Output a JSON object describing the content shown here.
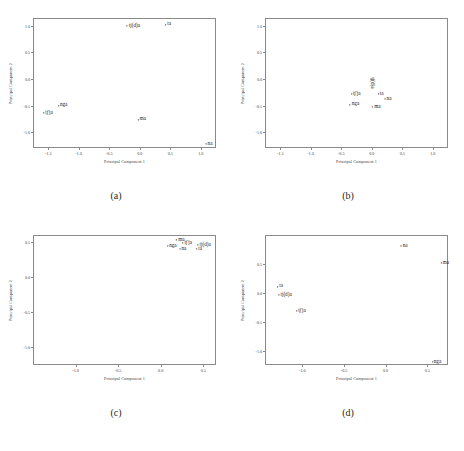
{
  "figure": {
    "panel_count": 4,
    "axis_line_color": "#8a8a8a",
    "text_color": "#1a1a1a",
    "background": "#ffffff"
  },
  "captions": {
    "a": "(a)",
    "b": "(b)",
    "c": "(c)",
    "d": "(d)"
  },
  "chart_data": [
    {
      "type": "scatter",
      "panel": "(a)",
      "title": "",
      "xlabel": "Principal Component 1",
      "ylabel": "Principal Component 2",
      "xlim": [
        -1.75,
        1.25
      ],
      "ylim": [
        -1.3,
        1.15
      ],
      "xticks": [
        -1.5,
        -1.0,
        -0.5,
        0.0,
        0.5,
        1.0
      ],
      "xticklabels": [
        "-1.5",
        "-1.0",
        "-0.5",
        "0.0",
        "0.5",
        "1.0"
      ],
      "yticks": [
        -1.0,
        -0.5,
        0.0,
        0.5,
        1.0
      ],
      "yticklabels": [
        "-1.0",
        "-0.5",
        "0.0",
        "0.5",
        "1.0"
      ],
      "grid": false,
      "legend": "none",
      "point_labels": [
        "tj(d)a",
        "ta",
        "nga",
        "tj'ja",
        "ma",
        "na"
      ],
      "points": [
        {
          "label": "tj(d)a",
          "x": -0.12,
          "y": 1.02
        },
        {
          "label": "ta",
          "x": 0.45,
          "y": 1.05
        },
        {
          "label": "nga",
          "x": -1.28,
          "y": -0.48
        },
        {
          "label": "tj'ja",
          "x": -1.52,
          "y": -0.62
        },
        {
          "label": "ma",
          "x": 0.02,
          "y": -0.74
        },
        {
          "label": "na",
          "x": 1.12,
          "y": -1.2
        }
      ]
    },
    {
      "type": "scatter",
      "panel": "(b)",
      "title": "",
      "xlabel": "Principal Component 1",
      "ylabel": "Principal Component 2",
      "xlim": [
        -1.75,
        1.25
      ],
      "ylim": [
        -1.3,
        1.15
      ],
      "xticks": [
        -1.5,
        -1.0,
        -0.5,
        0.0,
        0.5,
        1.0
      ],
      "xticklabels": [
        "-1.5",
        "-1.0",
        "-0.5",
        "0.0",
        "0.5",
        "1.0"
      ],
      "yticks": [
        -1.0,
        -0.5,
        0.0,
        0.5,
        1.0
      ],
      "yticklabels": [
        "-1.0",
        "-0.5",
        "0.0",
        "0.5",
        "1.0"
      ],
      "grid": false,
      "legend": "none",
      "point_labels": [
        "tj(d)a",
        "tj'ja",
        "ta",
        "na",
        "nga",
        "ma"
      ],
      "points": [
        {
          "label": "tj(d)a",
          "x": 0.0,
          "y": -0.05,
          "orientation": "vertical"
        },
        {
          "label": "tj'ja",
          "x": -0.28,
          "y": -0.26
        },
        {
          "label": "ta",
          "x": 0.13,
          "y": -0.26
        },
        {
          "label": "na",
          "x": 0.25,
          "y": -0.36
        },
        {
          "label": "nga",
          "x": -0.3,
          "y": -0.46
        },
        {
          "label": "ma",
          "x": 0.06,
          "y": -0.5
        }
      ]
    },
    {
      "type": "scatter",
      "panel": "(c)",
      "title": "",
      "xlabel": "Principal Component 1",
      "ylabel": "Principal Component 2",
      "xlim": [
        -1.5,
        0.65
      ],
      "ylim": [
        -1.25,
        0.6
      ],
      "xticks": [
        -1.0,
        -0.5,
        0.0,
        0.5
      ],
      "xticklabels": [
        "-1.0",
        "-0.5",
        "0.0",
        "0.5"
      ],
      "yticks": [
        -1.0,
        -0.5,
        0.0,
        0.5
      ],
      "yticklabels": [
        "-1.0",
        "-0.5",
        "0.0",
        "0.5"
      ],
      "grid": false,
      "legend": "none",
      "point_labels": [
        "ma",
        "tj'ja",
        "nga",
        "na",
        "ta",
        "tj(d)a"
      ],
      "points": [
        {
          "label": "ma",
          "x": 0.22,
          "y": 0.55
        },
        {
          "label": "tj'ja",
          "x": 0.3,
          "y": 0.5
        },
        {
          "label": "nga",
          "x": 0.12,
          "y": 0.46
        },
        {
          "label": "na",
          "x": 0.25,
          "y": 0.42
        },
        {
          "label": "ta",
          "x": 0.44,
          "y": 0.42
        },
        {
          "label": "tj(d)a",
          "x": 0.5,
          "y": 0.47
        }
      ]
    },
    {
      "type": "scatter",
      "panel": "(d)",
      "title": "",
      "xlabel": "Principal Component 1",
      "ylabel": "Principal Component 2",
      "xlim": [
        -1.45,
        0.75
      ],
      "ylim": [
        -1.25,
        1.0
      ],
      "xticks": [
        -1.0,
        -0.5,
        0.0,
        0.5
      ],
      "xticklabels": [
        "-1.0",
        "-0.5",
        "0.0",
        "0.5"
      ],
      "yticks": [
        -1.0,
        -0.5,
        0.0,
        0.5
      ],
      "yticklabels": [
        "-1.0",
        "-0.5",
        "0.0",
        "0.5"
      ],
      "grid": false,
      "legend": "none",
      "point_labels": [
        "na",
        "ma",
        "ta",
        "tj(d)a",
        "tj'ja",
        "nga"
      ],
      "points": [
        {
          "label": "na",
          "x": 0.21,
          "y": 0.83
        },
        {
          "label": "ma",
          "x": 0.7,
          "y": 0.53
        },
        {
          "label": "ta",
          "x": -1.28,
          "y": 0.13
        },
        {
          "label": "tj(d)a",
          "x": -1.22,
          "y": -0.02
        },
        {
          "label": "tj'ja",
          "x": -1.03,
          "y": -0.3
        },
        {
          "label": "nga",
          "x": 0.6,
          "y": -1.18
        }
      ]
    }
  ]
}
